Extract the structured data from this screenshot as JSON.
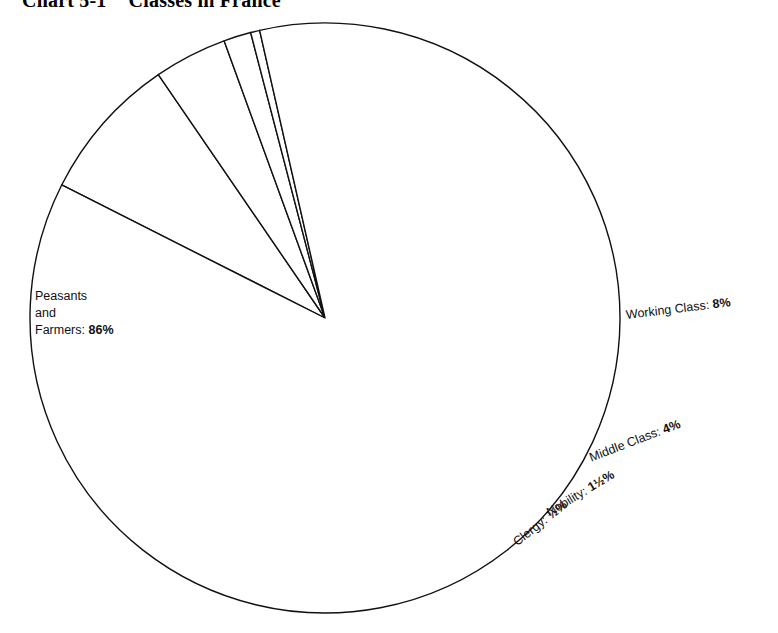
{
  "title": {
    "number": "Chart 5-1",
    "text": "Classes in France",
    "full": "Chart 5-1   Classes in France"
  },
  "chart_data": {
    "type": "pie",
    "subtitle": "",
    "xlabel": "",
    "ylabel": "",
    "grid": false,
    "legend": "none",
    "labels_inline": true,
    "total_percent": 100,
    "categories": [
      "Peasants and Farmers",
      "Working Class",
      "Middle Class",
      "Nobility",
      "Clergy"
    ],
    "values": [
      86,
      8,
      4,
      1.5,
      0.5
    ],
    "value_texts": [
      "86%",
      "8%",
      "4%",
      "1½%",
      "½%"
    ],
    "slices": [
      {
        "name": "Peasants and Farmers",
        "value": 86,
        "value_text": "86%",
        "label_lines": [
          "Peasants",
          "and",
          "Farmers:"
        ],
        "label_single": "Peasants and Farmers: 86%",
        "color": "#ffffff",
        "start_angle": 347.2,
        "sweep_angle": 309.6
      },
      {
        "name": "Working Class",
        "value": 8,
        "value_text": "8%",
        "label_lines": [
          "Working Class:"
        ],
        "label_single": "Working Class: 8%",
        "color": "#ffffff",
        "start_angle": 296.8,
        "sweep_angle": 28.8
      },
      {
        "name": "Middle Class",
        "value": 4,
        "value_text": "4%",
        "label_lines": [
          "Middle Class:"
        ],
        "label_single": "Middle Class: 4%",
        "color": "#ffffff",
        "start_angle": 325.6,
        "sweep_angle": 14.4
      },
      {
        "name": "Nobility",
        "value": 1.5,
        "value_text": "1½%",
        "label_lines": [
          "Nobility:"
        ],
        "label_single": "Nobility: 1½%",
        "color": "#ffffff",
        "start_angle": 340.0,
        "sweep_angle": 5.4
      },
      {
        "name": "Clergy",
        "value": 0.5,
        "value_text": "½%",
        "label_lines": [
          "Clergy:"
        ],
        "label_single": "Clergy: ½%",
        "color": "#ffffff",
        "start_angle": 345.4,
        "sweep_angle": 1.8
      }
    ],
    "geometry": {
      "center_x": 325,
      "center_y": 318,
      "radius": 295
    },
    "style": {
      "stroke": "#111111",
      "fill": "#ffffff"
    }
  }
}
